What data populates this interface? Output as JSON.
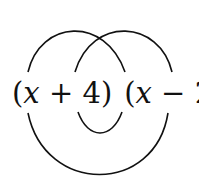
{
  "diagram": {
    "factor1": {
      "open": "(",
      "var": "x",
      "op": " + ",
      "const": "4",
      "close": ")"
    },
    "factor2": {
      "open": "(",
      "var": "x",
      "op": " − ",
      "const": "2",
      "close": ")"
    },
    "arcs": [
      {
        "name": "first",
        "from": "x",
        "to": "x",
        "side": "top"
      },
      {
        "name": "outer",
        "from": "x",
        "to": "2",
        "side": "bottom"
      },
      {
        "name": "inner",
        "from": "4",
        "to": "x",
        "side": "bottom"
      },
      {
        "name": "last",
        "from": "4",
        "to": "2",
        "side": "top"
      }
    ],
    "stroke_color": "#111111"
  }
}
